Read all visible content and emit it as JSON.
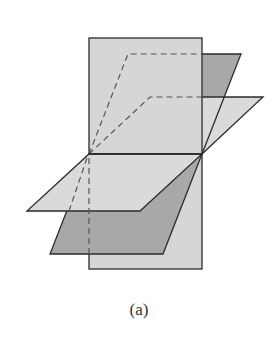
{
  "figure": {
    "caption": "(a)",
    "colors": {
      "vertical_plane": "#d6d6d6",
      "dark_plane": "#a8a8a8",
      "light_plane": "#d9d9d9",
      "stroke": "#2b2b2b",
      "dashed": "#555555"
    }
  }
}
